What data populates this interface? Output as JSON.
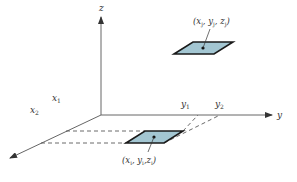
{
  "diagram": {
    "axes": {
      "z_label": "z",
      "y_label": "y",
      "x_label": ""
    },
    "ticks": {
      "x1": "x",
      "x1_sub": "1",
      "x2": "x",
      "x2_sub": "2",
      "y1": "y",
      "y1_sub": "1",
      "y2": "y",
      "y2_sub": "2"
    },
    "points": {
      "upper": {
        "label": "(x_j , y_j , z_j)",
        "x": "x",
        "xs": "j",
        "y": "y",
        "ys": "j",
        "z": "z",
        "zs": "j"
      },
      "lower": {
        "label": "(x_i , y_i , z_i)",
        "x": "x",
        "xs": "i",
        "y": "y",
        "ys": "i",
        "z": "z",
        "zs": "i"
      }
    },
    "colors": {
      "plane_fill": "#a3c6d2",
      "axis": "#555555",
      "outline": "#1a1a1a"
    }
  }
}
